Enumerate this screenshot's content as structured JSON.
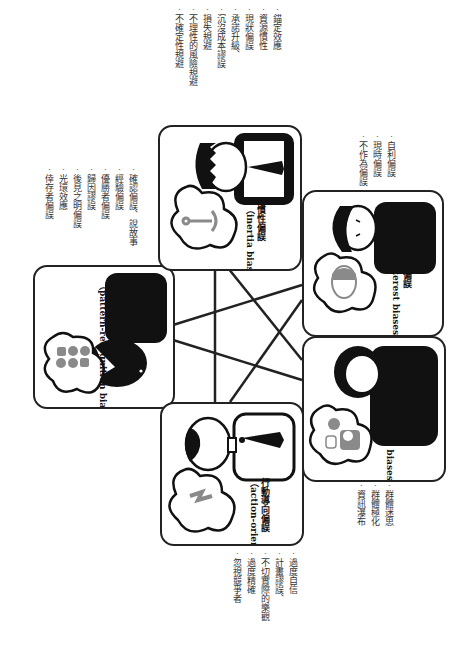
{
  "diagram": {
    "categories": [
      {
        "id": "pattern",
        "zh": "模式辨認偏誤",
        "en": "（pattern-recognition biases）",
        "icon": "grid-dots-icon",
        "items": [
          "確認偏誤、說故事",
          "經驗偏誤",
          "優勝者偏誤",
          "歸因謬誤",
          "後見之明偏誤",
          "光環效應",
          "倖存者偏誤"
        ]
      },
      {
        "id": "inertia",
        "zh": "慣性偏誤",
        "en": "（inertia biases）",
        "icon": "anchor-icon",
        "items": [
          "錨定效應",
          "資源慣性",
          "現狀偏誤",
          "承諾升級、",
          "沉沒成本謬誤",
          "損失規避",
          "不理性的風險規避",
          "不確定性規避"
        ]
      },
      {
        "id": "interest",
        "zh": "利益偏誤",
        "en": "（interest biases）",
        "icon": "face-icon",
        "items": [
          "自利偏誤",
          "現時偏誤",
          "不作為偏誤"
        ]
      },
      {
        "id": "social",
        "zh": "社會偏誤",
        "en": "（social biases）",
        "icon": "people-icon",
        "items": [
          "群體迷思",
          "群體極化",
          "資訊瀑布"
        ]
      },
      {
        "id": "action",
        "zh": "行動導向偏誤",
        "en": "（action-oriented biases）",
        "icon": "lightning-icon",
        "items": [
          "過度自信",
          "計畫謬誤、",
          "不切實際的樂觀",
          "過度精確",
          "忽視競爭者"
        ]
      }
    ],
    "colors": {
      "ink": "#222222",
      "icon_gray": "#8a8a8a",
      "background": "#ffffff"
    }
  }
}
